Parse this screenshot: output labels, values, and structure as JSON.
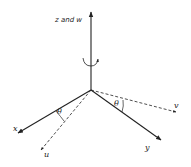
{
  "diagram": {
    "type": "coordinate-axes-rotation",
    "axes": {
      "z_w": {
        "label": "z and w",
        "style": "solid"
      },
      "x": {
        "label": "x",
        "style": "solid"
      },
      "y": {
        "label": "y",
        "style": "solid"
      },
      "u": {
        "label": "u",
        "style": "dashed"
      },
      "v": {
        "label": "v",
        "style": "dashed"
      }
    },
    "angles": [
      {
        "label": "θ",
        "between": [
          "x",
          "u"
        ]
      },
      {
        "label": "θ",
        "between": [
          "y",
          "v"
        ]
      }
    ],
    "rotation_indicator": "rotation-about-z-axis",
    "colors": {
      "line": "#222222",
      "background": "#ffffff"
    }
  }
}
